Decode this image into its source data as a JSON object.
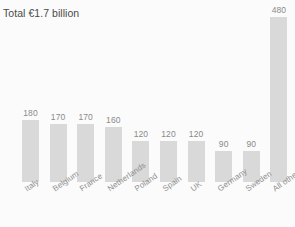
{
  "chart_data": {
    "type": "bar",
    "title": "",
    "subtitle": "Total €1.7 billion",
    "xlabel": "",
    "ylabel": "",
    "ylim": [
      0,
      480
    ],
    "grid": false,
    "legend": "none",
    "categories": [
      "Italy",
      "Belgium",
      "France",
      "Netherlands",
      "Poland",
      "Spain",
      "UK",
      "Germany",
      "Sweden",
      "All others"
    ],
    "values": [
      180,
      170,
      170,
      160,
      120,
      120,
      120,
      90,
      90,
      480
    ],
    "value_labels": [
      "180",
      "170",
      "170",
      "160",
      "120",
      "120",
      "120",
      "90",
      "90",
      "480"
    ],
    "bar_color": "#d9d9d9",
    "background_color": "#fbfbfb",
    "label_color": "#8f8f8f",
    "value_color": "#8a8a8a"
  }
}
